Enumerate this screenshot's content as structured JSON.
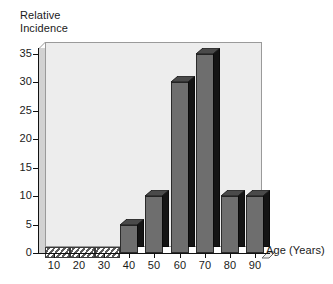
{
  "chart_data": {
    "type": "bar",
    "title": "",
    "xlabel": "Age (Years)",
    "ylabel": "Relative\nIncidence",
    "categories": [
      "10",
      "20",
      "30",
      "40",
      "50",
      "60",
      "70",
      "80",
      "90"
    ],
    "values": [
      0,
      0,
      0,
      5,
      10,
      30,
      35,
      10,
      10
    ],
    "ylim": [
      0,
      35
    ],
    "yticks": [
      0,
      5,
      10,
      15,
      20,
      25,
      30,
      35
    ],
    "ytick_labels": [
      "0",
      "5",
      "10",
      "15",
      "20",
      "25",
      "30",
      "35"
    ],
    "xtick_labels": [
      "10",
      "20",
      "30",
      "40",
      "50",
      "60",
      "70",
      "80",
      "90"
    ],
    "grid": false,
    "legend": null,
    "style": "3d-column",
    "colors": {
      "bar_front": "#6e6e6e",
      "bar_side": "#141414",
      "bar_top": "#4a4a4a",
      "plot_background": "#ededed",
      "wall": "#d2d2d2",
      "axis": "#111111",
      "text": "#1a1a1a",
      "page_background": "#ffffff"
    }
  }
}
